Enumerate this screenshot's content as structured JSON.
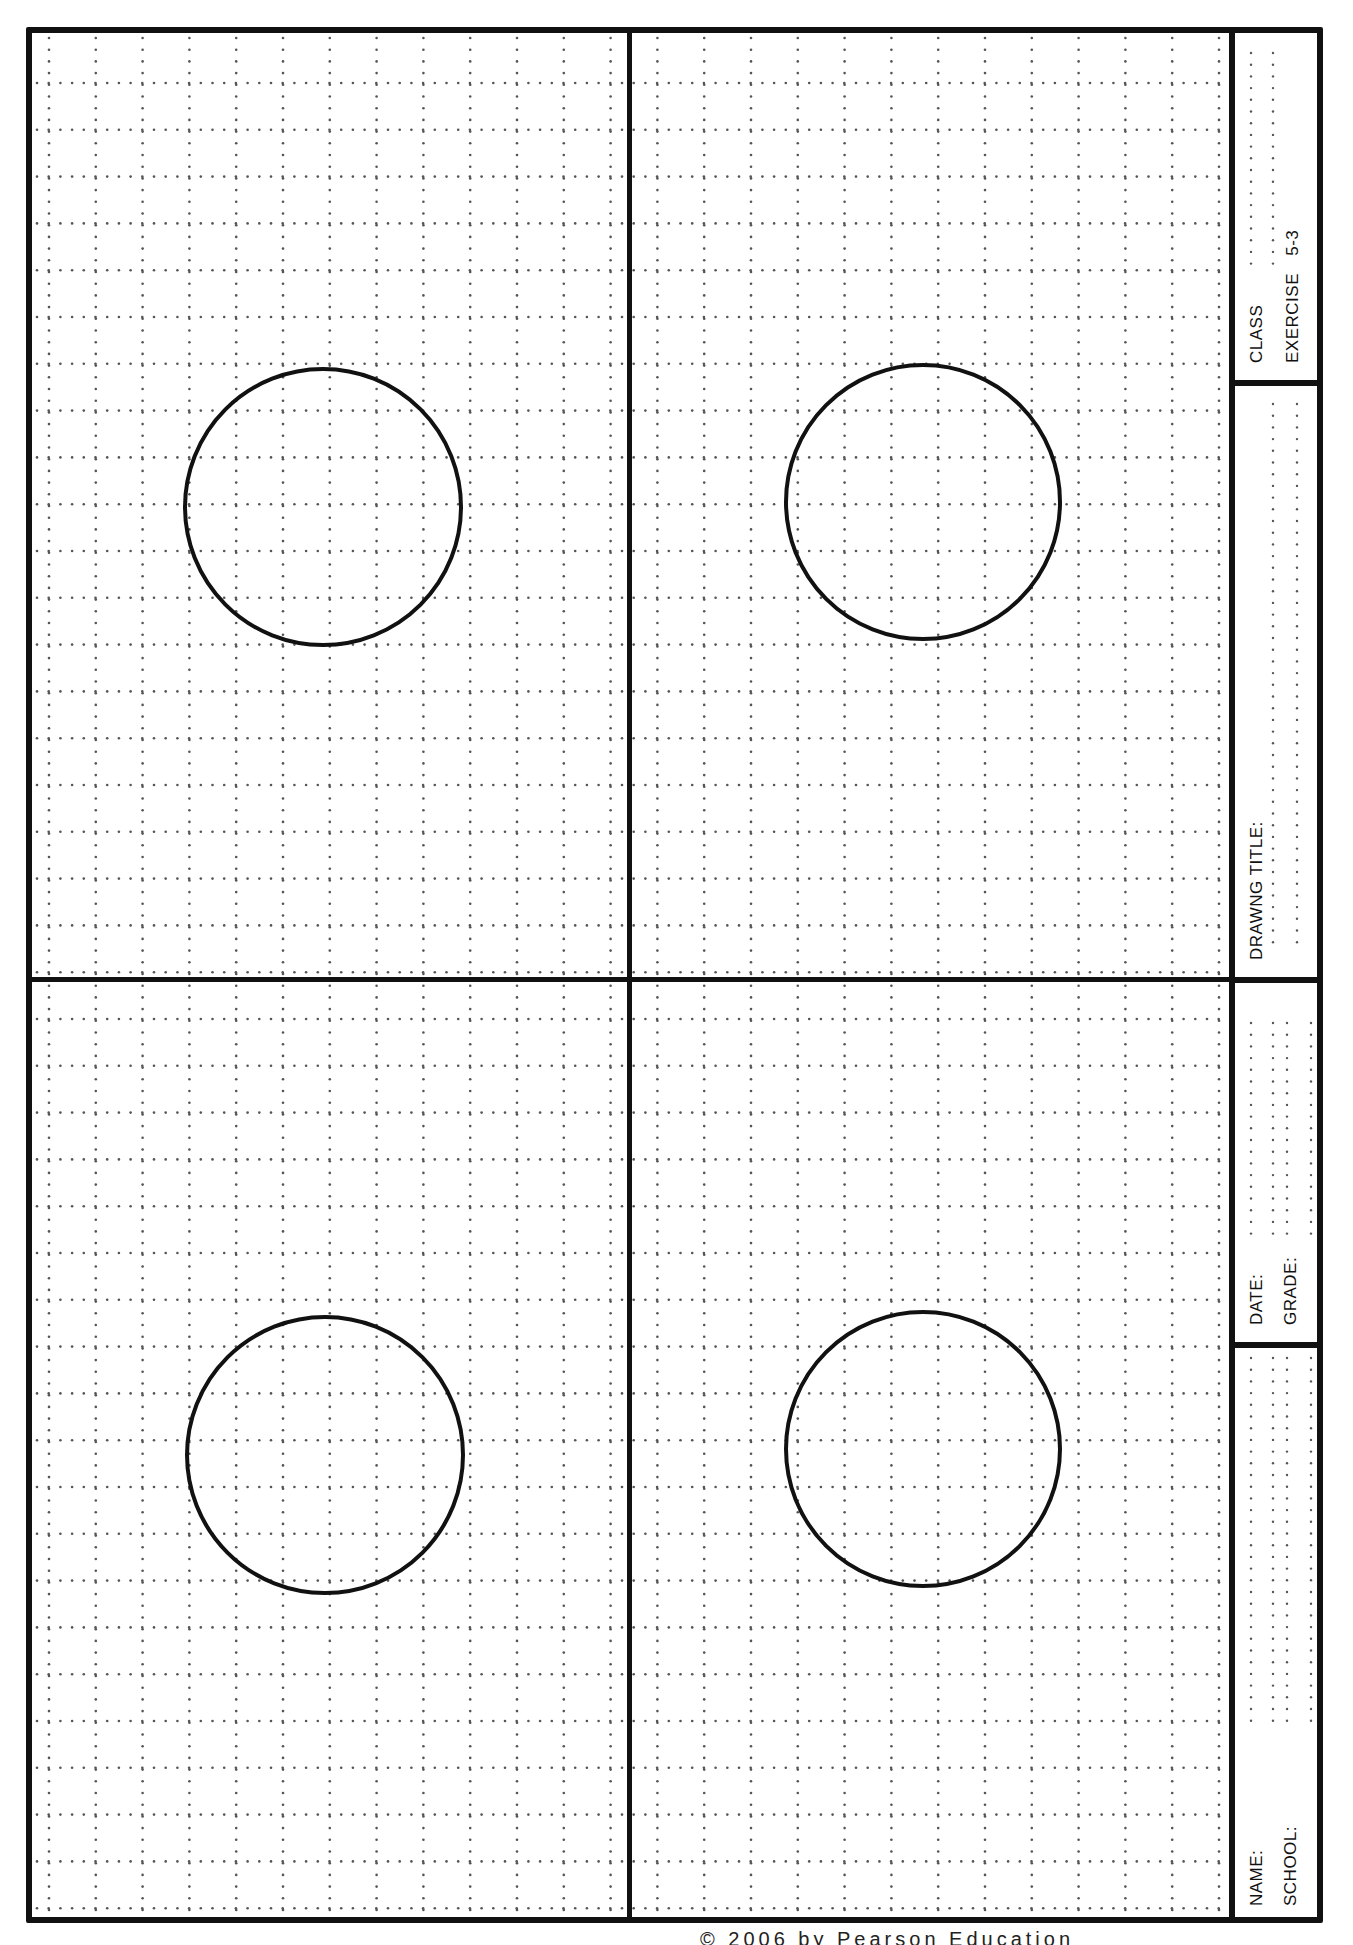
{
  "document": {
    "type": "drafting worksheet",
    "orientation": "landscape-rotated"
  },
  "title_block": {
    "class_label": "CLASS",
    "exercise_label": "EXERCISE",
    "exercise_number": "5-3",
    "drawing_title_label": "DRAWNG TITLE:",
    "date_label": "DATE:",
    "grade_label": "GRADE:",
    "name_label": "NAME:",
    "school_label": "SCHOOL:"
  },
  "panels": [
    {
      "id": "top-left",
      "circle": {
        "cx": 323,
        "cy": 507,
        "r": 140
      }
    },
    {
      "id": "top-right",
      "circle": {
        "cx": 923,
        "cy": 502,
        "r": 139
      }
    },
    {
      "id": "bottom-left",
      "circle": {
        "cx": 325,
        "cy": 1455,
        "r": 140
      }
    },
    {
      "id": "bottom-right",
      "circle": {
        "cx": 923,
        "cy": 1449,
        "r": 139
      }
    }
  ],
  "grid": {
    "major_spacing_px": 46.8,
    "dot_spacing_px": 11.7,
    "dot_color": "#555555",
    "line_color": "#111111"
  },
  "footer": {
    "copyright": "© 2006 by Pearson Education"
  }
}
